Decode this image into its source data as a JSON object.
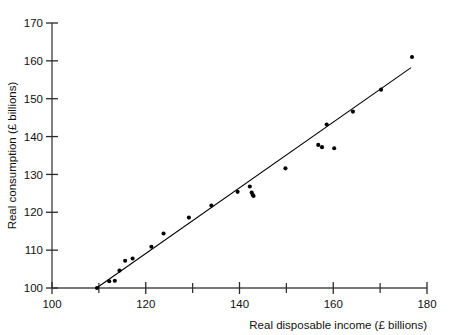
{
  "chart_data": {
    "type": "scatter",
    "title": "",
    "xlabel": "Real disposable income (£ billions)",
    "ylabel": "Real consumption (£ billions)",
    "xlim": [
      100,
      180
    ],
    "ylim": [
      100,
      170
    ],
    "xticks": [
      100,
      120,
      140,
      160,
      180
    ],
    "xticks_minor": [
      110,
      130,
      150,
      170
    ],
    "yticks": [
      100,
      110,
      120,
      130,
      140,
      150,
      160,
      170
    ],
    "xtick_labels": [
      "100",
      "120",
      "140",
      "160",
      "180"
    ],
    "ytick_labels": [
      "100",
      "110",
      "120",
      "130",
      "140",
      "150",
      "160",
      "170"
    ],
    "grid": false,
    "legend": null,
    "marker": "filled-circle",
    "marker_color": "#000000",
    "line_color": "#000000",
    "points": [
      {
        "x": 109.6,
        "y": 100.0
      },
      {
        "x": 112.2,
        "y": 101.8
      },
      {
        "x": 113.4,
        "y": 101.9
      },
      {
        "x": 114.4,
        "y": 104.6
      },
      {
        "x": 115.6,
        "y": 107.2
      },
      {
        "x": 117.2,
        "y": 107.8
      },
      {
        "x": 121.2,
        "y": 110.9
      },
      {
        "x": 123.8,
        "y": 114.4
      },
      {
        "x": 129.2,
        "y": 118.6
      },
      {
        "x": 134.0,
        "y": 121.8
      },
      {
        "x": 139.6,
        "y": 125.4
      },
      {
        "x": 142.2,
        "y": 126.8
      },
      {
        "x": 142.6,
        "y": 125.2
      },
      {
        "x": 142.8,
        "y": 124.6
      },
      {
        "x": 143.0,
        "y": 124.3
      },
      {
        "x": 149.8,
        "y": 131.6
      },
      {
        "x": 156.8,
        "y": 137.8
      },
      {
        "x": 157.6,
        "y": 137.2
      },
      {
        "x": 160.2,
        "y": 136.9
      },
      {
        "x": 158.6,
        "y": 143.2
      },
      {
        "x": 164.2,
        "y": 146.6
      },
      {
        "x": 170.2,
        "y": 152.4
      },
      {
        "x": 176.8,
        "y": 161.0
      }
    ],
    "fit_line": {
      "type": "linear-regression",
      "x_start": 109.5,
      "y_start": 100.0,
      "x_end": 176.6,
      "y_end": 158.2
    },
    "axis_style": {
      "left_spine": true,
      "bottom_spine": true,
      "top_spine": false,
      "right_spine": false,
      "tick_direction": "out-in"
    }
  }
}
